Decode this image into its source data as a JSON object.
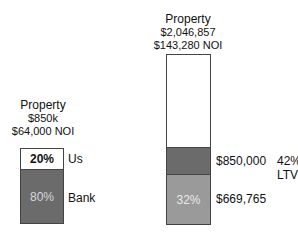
{
  "left": {
    "title": "Property",
    "value": "$850k",
    "noi": "$64,000 NOI",
    "segments": [
      {
        "label": "20%",
        "side": "Us",
        "color": "#ffffff"
      },
      {
        "label": "80%",
        "side": "Bank",
        "color": "#6b6b6b"
      }
    ]
  },
  "right": {
    "title": "Property",
    "value": "$2,046,857",
    "noi": "$143,280 NOI",
    "segments": [
      {
        "label": "",
        "color": "#ffffff"
      },
      {
        "label": "",
        "side": "$850,000",
        "extra": "42%",
        "extra2": "LTV",
        "color": "#6b6b6b"
      },
      {
        "label": "32%",
        "side": "$669,765",
        "color": "#9a9a9a"
      }
    ]
  }
}
